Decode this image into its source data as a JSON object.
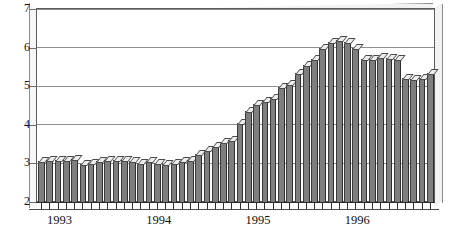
{
  "chart_data": {
    "type": "bar",
    "title": "",
    "subtitle": "",
    "xlabel": "",
    "ylabel": "",
    "ylim": [
      2,
      7
    ],
    "ytick_labels": [
      "2",
      "3",
      "4",
      "5",
      "6",
      "7"
    ],
    "ytick_values": [
      2,
      3,
      4,
      5,
      6,
      7
    ],
    "grid": true,
    "legend": null,
    "legend_position": "none",
    "xtick_labels": [
      "1993",
      "1994",
      "1995",
      "1996"
    ],
    "xtick_values": [
      1993,
      1994,
      1995,
      1996
    ],
    "bar_style": "3d-shaded-gray",
    "colors": {
      "bar_fill": "#7e7e7e",
      "bar_edge": "#2e2e2e",
      "bar_cap": "#ededed",
      "gridline": "#8f8f8f",
      "frame": "#5a5a5a",
      "background": "#ffffff",
      "text": "#111111"
    },
    "categories": [
      "1993-01",
      "1993-02",
      "1993-03",
      "1993-04",
      "1993-05",
      "1993-06",
      "1993-07",
      "1993-08",
      "1993-09",
      "1993-10",
      "1993-11",
      "1993-12",
      "1994-01",
      "1994-02",
      "1994-03",
      "1994-04",
      "1994-05",
      "1994-06",
      "1994-07",
      "1994-08",
      "1994-09",
      "1994-10",
      "1994-11",
      "1994-12",
      "1995-01",
      "1995-02",
      "1995-03",
      "1995-04",
      "1995-05",
      "1995-06",
      "1995-07",
      "1995-08",
      "1995-09",
      "1995-10",
      "1995-11",
      "1995-12",
      "1996-01",
      "1996-02",
      "1996-03",
      "1996-04",
      "1996-05",
      "1996-06",
      "1996-07",
      "1996-08",
      "1996-09",
      "1996-10",
      "1996-11",
      "1996-12"
    ],
    "values": [
      3.05,
      3.08,
      3.08,
      3.1,
      3.12,
      2.98,
      3.0,
      3.05,
      3.08,
      3.1,
      3.08,
      3.05,
      3.02,
      3.05,
      3.0,
      2.98,
      3.02,
      3.05,
      3.1,
      3.25,
      3.35,
      3.45,
      3.55,
      3.6,
      4.05,
      4.35,
      4.55,
      4.62,
      4.7,
      4.98,
      5.05,
      5.35,
      5.55,
      5.7,
      5.98,
      6.15,
      6.2,
      6.15,
      5.98,
      5.7,
      5.7,
      5.75,
      5.72,
      5.7,
      5.22,
      5.18,
      5.22,
      5.35
    ]
  },
  "axis": {
    "y_title": "",
    "x_title": ""
  }
}
